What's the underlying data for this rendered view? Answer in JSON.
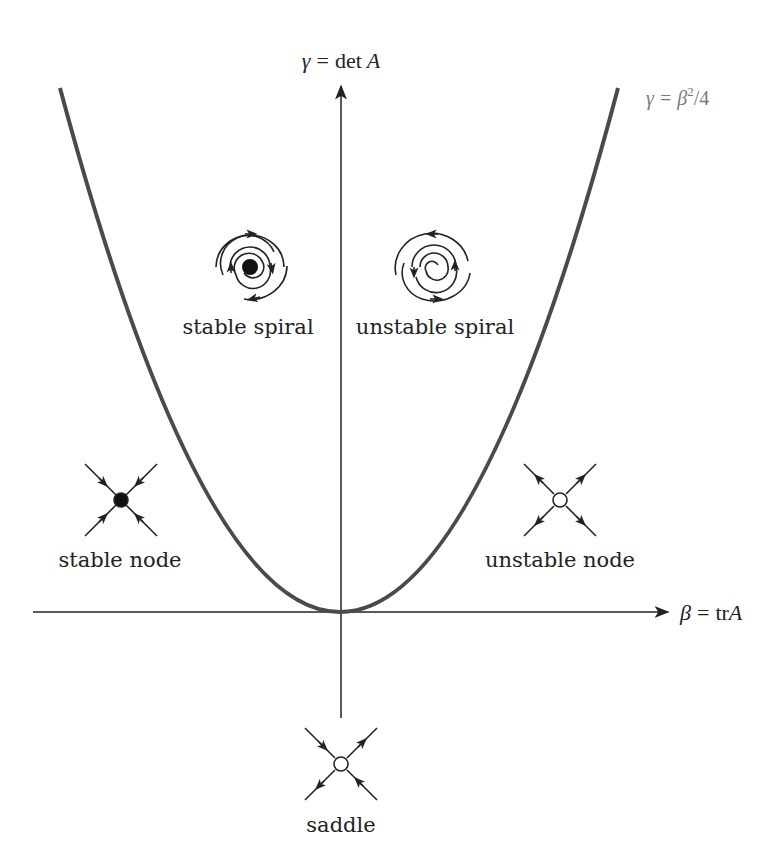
{
  "diagram": {
    "axes": {
      "y_label": {
        "lhs": "γ",
        "eq": "=",
        "rhs_fn": "det",
        "rhs_var": "A"
      },
      "x_label": {
        "lhs": "β",
        "eq": "=",
        "rhs_fn": "tr",
        "rhs_var": "A"
      }
    },
    "curve_label": {
      "lhs": "γ",
      "eq": "=",
      "base": "β",
      "exp": "2",
      "rest": "/4"
    },
    "colors": {
      "curve": "#4a4a4a",
      "axes": "#222222",
      "curve_label": "#7a7a7a",
      "text": "#222222"
    },
    "regions": [
      {
        "id": "stable-spiral",
        "label": "stable spiral",
        "icon": "stable-spiral-icon"
      },
      {
        "id": "unstable-spiral",
        "label": "unstable spiral",
        "icon": "unstable-spiral-icon"
      },
      {
        "id": "stable-node",
        "label": "stable node",
        "icon": "stable-node-icon"
      },
      {
        "id": "unstable-node",
        "label": "unstable node",
        "icon": "unstable-node-icon"
      },
      {
        "id": "saddle",
        "label": "saddle",
        "icon": "saddle-icon"
      }
    ]
  }
}
